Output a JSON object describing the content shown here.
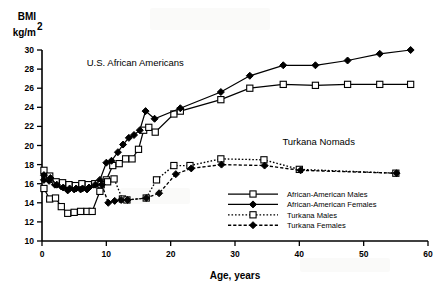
{
  "chart_data": {
    "type": "line",
    "title": "",
    "xlabel": "Age,  years",
    "ylabel_line1": "BMI",
    "ylabel_line2": "kg/m",
    "ylabel_exp": "2",
    "xlim": [
      0,
      60
    ],
    "ylim": [
      10,
      30
    ],
    "xticks": [
      0,
      10,
      20,
      30,
      40,
      50,
      60
    ],
    "yticks": [
      10,
      12,
      14,
      16,
      18,
      20,
      22,
      24,
      26,
      28,
      30
    ],
    "grid": false,
    "legend_position": "center-right-inside",
    "annotations": [
      {
        "text": "U.S. African Americans",
        "x": 14.5,
        "y": 28.3
      },
      {
        "text": "Turkana Nomads",
        "x": 43.0,
        "y": 20.1
      }
    ],
    "series": [
      {
        "name": "African-American Males",
        "marker": "open-square",
        "line_style": "solid",
        "points": [
          [
            0.3,
            15.5
          ],
          [
            1.2,
            14.4
          ],
          [
            2.1,
            14.5
          ],
          [
            3.0,
            13.6
          ],
          [
            4.0,
            12.9
          ],
          [
            5.0,
            13.0
          ],
          [
            6.0,
            13.1
          ],
          [
            7.0,
            13.1
          ],
          [
            7.8,
            13.1
          ],
          [
            9.0,
            15.2
          ],
          [
            10.0,
            16.4
          ],
          [
            11.0,
            17.9
          ],
          [
            12.0,
            18.1
          ],
          [
            13.0,
            18.6
          ],
          [
            14.0,
            18.6
          ],
          [
            15.0,
            19.6
          ],
          [
            15.8,
            21.6
          ],
          [
            16.6,
            21.9
          ],
          [
            17.6,
            21.4
          ],
          [
            20.5,
            23.3
          ],
          [
            21.5,
            23.6
          ],
          [
            27.8,
            24.8
          ],
          [
            32.3,
            26.0
          ],
          [
            37.5,
            26.4
          ],
          [
            42.5,
            26.3
          ],
          [
            47.5,
            26.4
          ],
          [
            52.5,
            26.4
          ],
          [
            57.3,
            26.4
          ]
        ]
      },
      {
        "name": "African-American Females",
        "marker": "filled-diamond",
        "line_style": "solid",
        "points": [
          [
            0.3,
            16.4
          ],
          [
            1.1,
            16.3
          ],
          [
            2.0,
            15.9
          ],
          [
            3.0,
            15.7
          ],
          [
            4.0,
            15.3
          ],
          [
            5.0,
            15.4
          ],
          [
            6.0,
            15.4
          ],
          [
            7.0,
            15.4
          ],
          [
            8.0,
            15.9
          ],
          [
            9.0,
            16.4
          ],
          [
            10.0,
            18.2
          ],
          [
            10.8,
            18.4
          ],
          [
            11.8,
            19.3
          ],
          [
            12.6,
            20.1
          ],
          [
            13.5,
            20.8
          ],
          [
            14.3,
            21.1
          ],
          [
            15.2,
            21.6
          ],
          [
            16.1,
            23.6
          ],
          [
            17.5,
            22.8
          ],
          [
            21.5,
            23.9
          ],
          [
            27.8,
            25.6
          ],
          [
            32.3,
            27.3
          ],
          [
            37.5,
            28.4
          ],
          [
            42.5,
            28.4
          ],
          [
            47.5,
            28.9
          ],
          [
            52.5,
            29.6
          ],
          [
            57.3,
            30.0
          ]
        ]
      },
      {
        "name": "Turkana Males",
        "marker": "open-square",
        "line_style": "dotted",
        "points": [
          [
            0.3,
            17.4
          ],
          [
            1.2,
            16.8
          ],
          [
            2.2,
            16.2
          ],
          [
            3.2,
            16.1
          ],
          [
            4.2,
            15.9
          ],
          [
            5.2,
            15.8
          ],
          [
            6.2,
            16.0
          ],
          [
            7.2,
            15.9
          ],
          [
            8.2,
            16.0
          ],
          [
            9.2,
            15.9
          ],
          [
            10.2,
            16.2
          ],
          [
            11.2,
            16.5
          ],
          [
            12.5,
            14.4
          ],
          [
            13.2,
            14.3
          ],
          [
            16.2,
            14.5
          ],
          [
            17.8,
            16.4
          ],
          [
            20.5,
            17.9
          ],
          [
            23.0,
            17.9
          ],
          [
            27.8,
            18.6
          ],
          [
            34.5,
            18.5
          ],
          [
            40.0,
            17.5
          ],
          [
            55.0,
            17.1
          ]
        ]
      },
      {
        "name": "Turkana Females",
        "marker": "filled-diamond",
        "line_style": "dashed",
        "points": [
          [
            0.3,
            16.9
          ],
          [
            1.3,
            16.6
          ],
          [
            2.3,
            15.9
          ],
          [
            3.3,
            15.6
          ],
          [
            4.3,
            15.5
          ],
          [
            5.3,
            15.5
          ],
          [
            6.3,
            15.5
          ],
          [
            7.3,
            15.6
          ],
          [
            8.3,
            15.9
          ],
          [
            9.3,
            15.9
          ],
          [
            10.3,
            14.0
          ],
          [
            11.3,
            14.2
          ],
          [
            12.3,
            14.3
          ],
          [
            13.3,
            14.3
          ],
          [
            16.2,
            14.5
          ],
          [
            18.2,
            15.0
          ],
          [
            20.8,
            17.0
          ],
          [
            23.2,
            17.6
          ],
          [
            27.9,
            18.0
          ],
          [
            34.6,
            17.9
          ],
          [
            40.2,
            17.4
          ],
          [
            55.1,
            17.1
          ]
        ]
      }
    ],
    "legend_entries": [
      {
        "label": "African-American Males",
        "marker": "open-square",
        "line_style": "solid"
      },
      {
        "label": "African-American Females",
        "marker": "filled-diamond",
        "line_style": "solid"
      },
      {
        "label": "Turkana Males",
        "marker": "open-square",
        "line_style": "dotted"
      },
      {
        "label": "Turkana Females",
        "marker": "filled-diamond",
        "line_style": "dashed"
      }
    ]
  }
}
